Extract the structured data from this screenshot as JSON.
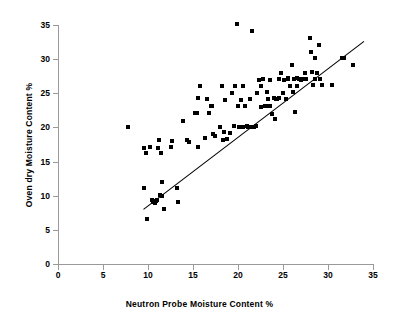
{
  "chart_data": {
    "type": "scatter",
    "title": "",
    "xlabel": "Neutron Probe Moisture Content %",
    "ylabel": "Oven dry Moisture Content %",
    "xlim": [
      0,
      35
    ],
    "ylim": [
      0,
      35
    ],
    "xticks": [
      0,
      5,
      10,
      15,
      20,
      25,
      30,
      35
    ],
    "yticks": [
      0,
      5,
      10,
      15,
      20,
      25,
      30,
      35
    ],
    "grid": false,
    "legend": "none",
    "marker": "filled-square",
    "marker_color": "#000000",
    "series": [
      {
        "name": "Moisture content samples",
        "points": [
          [
            7.8,
            20.0
          ],
          [
            9.5,
            11.1
          ],
          [
            9.6,
            17.0
          ],
          [
            9.8,
            16.2
          ],
          [
            9.9,
            6.6
          ],
          [
            10.2,
            17.2
          ],
          [
            10.4,
            9.3
          ],
          [
            10.5,
            9.1
          ],
          [
            10.7,
            9.1
          ],
          [
            10.8,
            9.0
          ],
          [
            10.9,
            9.2
          ],
          [
            11.0,
            9.3
          ],
          [
            11.1,
            17.0
          ],
          [
            11.2,
            18.1
          ],
          [
            11.3,
            10.1
          ],
          [
            11.4,
            16.2
          ],
          [
            11.5,
            12.0
          ],
          [
            11.6,
            10.0
          ],
          [
            11.8,
            8.0
          ],
          [
            12.6,
            17.1
          ],
          [
            12.7,
            18.0
          ],
          [
            13.2,
            11.1
          ],
          [
            13.3,
            9.1
          ],
          [
            13.9,
            21.0
          ],
          [
            14.3,
            18.1
          ],
          [
            14.5,
            17.8
          ],
          [
            15.2,
            22.1
          ],
          [
            15.4,
            22.1
          ],
          [
            15.5,
            24.3
          ],
          [
            15.6,
            17.2
          ],
          [
            15.8,
            26.0
          ],
          [
            16.3,
            18.5
          ],
          [
            16.6,
            24.1
          ],
          [
            16.8,
            22.1
          ],
          [
            17.0,
            23.2
          ],
          [
            17.1,
            23.1
          ],
          [
            17.2,
            19.0
          ],
          [
            17.4,
            18.8
          ],
          [
            18.0,
            20.1
          ],
          [
            18.2,
            26.0
          ],
          [
            18.3,
            18.2
          ],
          [
            18.4,
            19.3
          ],
          [
            18.6,
            24.0
          ],
          [
            18.8,
            18.3
          ],
          [
            19.1,
            19.2
          ],
          [
            19.3,
            25.1
          ],
          [
            19.5,
            20.2
          ],
          [
            19.7,
            26.0
          ],
          [
            19.9,
            35.1
          ],
          [
            20.0,
            23.2
          ],
          [
            20.1,
            20.1
          ],
          [
            20.3,
            24.0
          ],
          [
            20.5,
            26.0
          ],
          [
            20.6,
            20.0
          ],
          [
            20.8,
            23.2
          ],
          [
            21.0,
            20.2
          ],
          [
            21.1,
            20.0
          ],
          [
            21.3,
            24.1
          ],
          [
            21.5,
            34.1
          ],
          [
            21.6,
            20.1
          ],
          [
            21.8,
            20.1
          ],
          [
            22.0,
            20.2
          ],
          [
            22.1,
            25.0
          ],
          [
            22.3,
            27.0
          ],
          [
            22.5,
            23.0
          ],
          [
            22.6,
            26.0
          ],
          [
            22.8,
            27.1
          ],
          [
            23.0,
            23.1
          ],
          [
            23.1,
            23.2
          ],
          [
            23.2,
            25.2
          ],
          [
            23.3,
            24.1
          ],
          [
            23.5,
            23.2
          ],
          [
            23.6,
            27.0
          ],
          [
            23.8,
            22.0
          ],
          [
            24.0,
            24.3
          ],
          [
            24.1,
            21.2
          ],
          [
            24.2,
            24.2
          ],
          [
            24.3,
            24.2
          ],
          [
            24.5,
            27.1
          ],
          [
            24.6,
            24.3
          ],
          [
            24.8,
            28.0
          ],
          [
            25.0,
            25.1
          ],
          [
            25.1,
            27.0
          ],
          [
            25.3,
            24.2
          ],
          [
            25.5,
            27.2
          ],
          [
            25.6,
            27.1
          ],
          [
            25.8,
            26.1
          ],
          [
            26.0,
            29.1
          ],
          [
            26.1,
            25.2
          ],
          [
            26.2,
            27.1
          ],
          [
            26.3,
            22.2
          ],
          [
            26.5,
            27.2
          ],
          [
            26.6,
            26.0
          ],
          [
            26.8,
            27.1
          ],
          [
            27.0,
            27.0
          ],
          [
            27.2,
            27.1
          ],
          [
            27.4,
            28.0
          ],
          [
            27.6,
            27.1
          ],
          [
            28.0,
            33.1
          ],
          [
            28.1,
            31.1
          ],
          [
            28.2,
            28.1
          ],
          [
            28.3,
            26.2
          ],
          [
            28.5,
            27.1
          ],
          [
            28.6,
            30.1
          ],
          [
            28.8,
            28.0
          ],
          [
            29.0,
            32.1
          ],
          [
            29.1,
            27.1
          ],
          [
            29.3,
            26.2
          ],
          [
            30.4,
            26.2
          ],
          [
            31.5,
            30.1
          ],
          [
            31.8,
            30.2
          ],
          [
            32.8,
            29.1
          ]
        ]
      }
    ],
    "trendline": {
      "name": "linear fit",
      "x_start": 9.5,
      "y_start": 8.0,
      "x_end": 34.0,
      "y_end": 32.6,
      "color": "#000000"
    }
  }
}
